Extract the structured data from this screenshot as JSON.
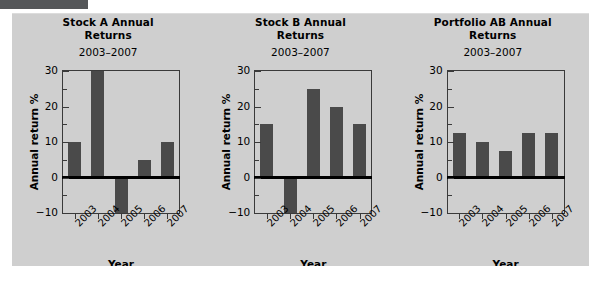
{
  "figure": {
    "background_color": "#cfcfcf",
    "bar_color": "#4a4a4a",
    "axis_color": "#3a3a3a",
    "corner_bar_color": "#555759"
  },
  "chart_data": [
    {
      "type": "bar",
      "title": "Stock A Annual Returns",
      "title_line1": "Stock A Annual",
      "title_line2": "Returns",
      "subtitle": "2003–2007",
      "xlabel": "Year",
      "ylabel": "Annual return %",
      "categories": [
        "2003",
        "2004",
        "2005",
        "2006",
        "2007"
      ],
      "values": [
        10,
        30,
        -10,
        5,
        10
      ],
      "ylim": [
        -10,
        30
      ],
      "yticks": [
        30,
        20,
        10,
        0,
        -10
      ],
      "ytick_labels": [
        "30",
        "20",
        "10",
        "0",
        "−10"
      ],
      "yminor_step": 5,
      "grid": false,
      "legend": "none"
    },
    {
      "type": "bar",
      "title": "Stock B Annual Returns",
      "title_line1": "Stock B Annual",
      "title_line2": "Returns",
      "subtitle": "2003–2007",
      "xlabel": "Year",
      "ylabel": "Annual return %",
      "categories": [
        "2003",
        "2004",
        "2005",
        "2006",
        "2007"
      ],
      "values": [
        15,
        -10,
        25,
        20,
        15
      ],
      "ylim": [
        -10,
        30
      ],
      "yticks": [
        30,
        20,
        10,
        0,
        -10
      ],
      "ytick_labels": [
        "30",
        "20",
        "10",
        "0",
        "−10"
      ],
      "yminor_step": 5,
      "grid": false,
      "legend": "none"
    },
    {
      "type": "bar",
      "title": "Portfolio AB Annual Returns",
      "title_line1": "Portfolio AB Annual",
      "title_line2": "Returns",
      "subtitle": "2003–2007",
      "xlabel": "Year",
      "ylabel": "Annual return %",
      "categories": [
        "2003",
        "2004",
        "2005",
        "2006",
        "2007"
      ],
      "values": [
        12.5,
        10,
        7.5,
        12.5,
        12.5
      ],
      "ylim": [
        -10,
        30
      ],
      "yticks": [
        30,
        20,
        10,
        0,
        -10
      ],
      "ytick_labels": [
        "30",
        "20",
        "10",
        "0",
        "−10"
      ],
      "yminor_step": 5,
      "grid": false,
      "legend": "none"
    }
  ]
}
